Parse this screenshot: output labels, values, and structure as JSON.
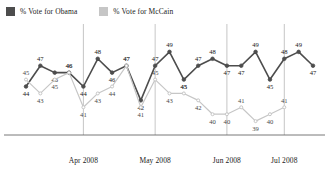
{
  "legend": {
    "entries": [
      {
        "label": "% Vote for Obama",
        "color": "#4d4d4d",
        "icon": "square-swatch"
      },
      {
        "label": "% Vote for McCain",
        "color": "#c6c6c6",
        "icon": "square-swatch"
      }
    ]
  },
  "chart_data": {
    "type": "line",
    "title": "",
    "subtitle": "",
    "xlabel": "",
    "ylabel": "",
    "ylim": [
      37,
      51
    ],
    "grid": "vertical-only",
    "legend_position": "top-left",
    "x": [
      1,
      2,
      3,
      4,
      5,
      6,
      7,
      8,
      9,
      10,
      11,
      12,
      13,
      14,
      15,
      16,
      17,
      18,
      19,
      20,
      21
    ],
    "tick_labels": [
      "Apr 2008",
      "May 2008",
      "Jun 2008",
      "Jul 2008"
    ],
    "tick_positions": [
      4,
      9,
      14,
      18
    ],
    "series": [
      {
        "name": "% Vote for Obama",
        "color": "#4d4d4d",
        "values": [
          44,
          47,
          46,
          46,
          44,
          48,
          46,
          47,
          42,
          47,
          49,
          45,
          47,
          48,
          47,
          47,
          49,
          45,
          48,
          49,
          47
        ]
      },
      {
        "name": "% Vote for McCain",
        "color": "#c6c6c6",
        "values": [
          45,
          43,
          45,
          46,
          41,
          43,
          44,
          47,
          41,
          45,
          43,
          43,
          42,
          40,
          40,
          41,
          39,
          40,
          41,
          null,
          null
        ]
      }
    ]
  }
}
